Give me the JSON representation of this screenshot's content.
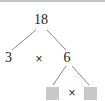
{
  "diagram": {
    "type": "factor-tree",
    "line_color": "#8a8a8a",
    "text_color": "#1a1a1a",
    "placeholder_color": "#c8c8c8",
    "background_color": "#ffffff",
    "top_border_color": "#c4c4c4"
  },
  "nodes": {
    "root": {
      "label": "18",
      "x": 41,
      "y": 19
    },
    "left": {
      "label": "3",
      "x": 8,
      "y": 57
    },
    "right": {
      "label": "6",
      "x": 67,
      "y": 57
    },
    "leaf_left": {
      "label": "",
      "x": 52,
      "y": 91,
      "state": "empty-placeholder"
    },
    "leaf_right": {
      "label": "",
      "x": 90,
      "y": 91,
      "state": "empty-placeholder"
    }
  },
  "operators": {
    "level1": {
      "symbol": "×",
      "icon": "multiply-icon",
      "x": 38,
      "y": 57
    },
    "level2": {
      "symbol": "×",
      "icon": "multiply-icon",
      "x": 71,
      "y": 91
    }
  },
  "edges": [
    {
      "name": "root-to-left",
      "x1": 36,
      "y1": 28,
      "x2": 12,
      "y2": 48
    },
    {
      "name": "root-to-right",
      "x1": 47,
      "y1": 28,
      "x2": 66,
      "y2": 48
    },
    {
      "name": "right-to-leaf-left",
      "x1": 66,
      "y1": 64,
      "x2": 53,
      "y2": 83
    },
    {
      "name": "right-to-leaf-right",
      "x1": 72,
      "y1": 64,
      "x2": 89,
      "y2": 83
    }
  ],
  "equation": {
    "expression": "18 = 3 × 6",
    "sub_expression": "6 = ? × ?"
  }
}
